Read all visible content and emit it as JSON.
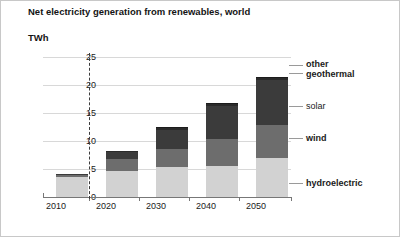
{
  "chart_data": {
    "type": "bar",
    "title": "Net electricity generation from renewables, world",
    "ylabel": "TWh",
    "xlabel": "",
    "categories": [
      "2010",
      "2020",
      "2030",
      "2040",
      "2050"
    ],
    "yticks": [
      "0",
      "5",
      "10",
      "15",
      "20",
      "25"
    ],
    "ylim": [
      0,
      25
    ],
    "grid": true,
    "legend_position": "right",
    "stacked": true,
    "series": [
      {
        "name": "hydroelectric",
        "color": "#d2d2d2",
        "values": [
          3.6,
          4.7,
          5.3,
          5.6,
          6.9
        ]
      },
      {
        "name": "wind",
        "color": "#6d6d6d",
        "values": [
          0.4,
          2.1,
          3.3,
          4.7,
          6.0
        ]
      },
      {
        "name": "solar",
        "color": "#3b3b3b",
        "values": [
          0.1,
          1.2,
          3.4,
          6.0,
          8.0
        ]
      },
      {
        "name": "geothermal",
        "color": "#2a2a2a",
        "values": [
          0.05,
          0.2,
          0.3,
          0.3,
          0.4
        ]
      },
      {
        "name": "other",
        "color": "#1c1c1c",
        "values": [
          0.05,
          0.1,
          0.2,
          0.2,
          0.2
        ]
      }
    ],
    "totals": [
      4.2,
      8.3,
      12.5,
      16.8,
      21.5
    ],
    "annotations": [
      "projection divider between 2010 and 2020"
    ]
  },
  "legend": {
    "other": "other",
    "geothermal": "geothermal",
    "solar": "solar",
    "wind": "wind",
    "hydroelectric": "hydroelectric"
  }
}
